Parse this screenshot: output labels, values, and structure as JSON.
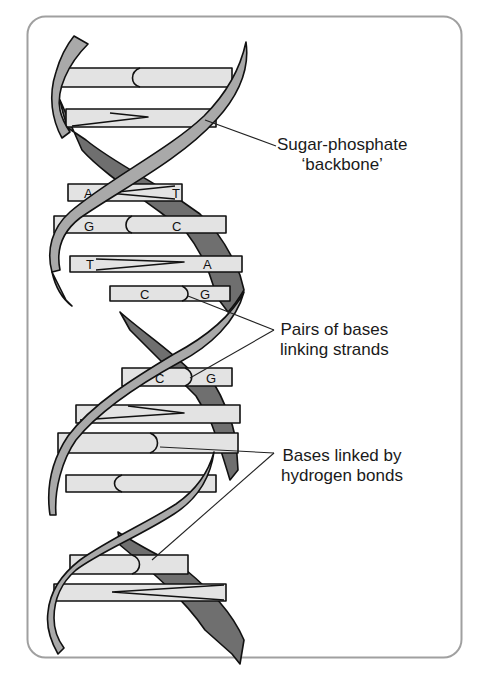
{
  "diagram": {
    "type": "dna-double-helix",
    "colors": {
      "front_strand": "#a9a9a9",
      "back_strand": "#6f6f6f",
      "base_fill": "#e3e3e3",
      "outline": "#111111",
      "frame": "#a0a0a0",
      "text": "#1a1a1a"
    },
    "base_pairs": [
      {
        "left": "",
        "right": "",
        "bond": "curve"
      },
      {
        "left": "",
        "right": "",
        "bond": "zigzag"
      },
      {
        "left": "A",
        "right": "T",
        "bond": "zigzag"
      },
      {
        "left": "G",
        "right": "C",
        "bond": "curve"
      },
      {
        "left": "T",
        "right": "A",
        "bond": "zigzag"
      },
      {
        "left": "C",
        "right": "G",
        "bond": "curve"
      },
      {
        "left": "C",
        "right": "G",
        "bond": "curve"
      },
      {
        "left": "",
        "right": "",
        "bond": "zigzag"
      },
      {
        "left": "",
        "right": "",
        "bond": "curve"
      },
      {
        "left": "",
        "right": "",
        "bond": "curve"
      },
      {
        "left": "",
        "right": "",
        "bond": "curve"
      },
      {
        "left": "",
        "right": "",
        "bond": "zigzag"
      }
    ],
    "labels": {
      "backbone_line1": "Sugar-phosphate",
      "backbone_line2": "‘backbone’",
      "pairs_line1": "Pairs of bases",
      "pairs_line2": "linking strands",
      "hbonds_line1": "Bases linked by",
      "hbonds_line2": "hydrogen bonds"
    },
    "base_letters": {
      "p3_left": "A",
      "p3_right": "T",
      "p4_left": "G",
      "p4_right": "C",
      "p5_left": "T",
      "p5_right": "A",
      "p6_left": "C",
      "p6_right": "G",
      "p7_left": "C",
      "p7_right": "G"
    }
  }
}
